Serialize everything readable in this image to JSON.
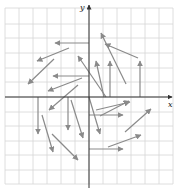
{
  "diagram": {
    "type": "vector-field",
    "axes": {
      "x_label": "x",
      "y_label": "y",
      "origin_px": [
        89,
        97
      ],
      "unit_px": 14.5
    },
    "grid": {
      "x_lines_px": [
        5,
        19,
        33,
        47,
        61,
        75,
        89,
        103,
        117,
        131,
        145,
        159,
        173
      ],
      "y_lines_px": [
        8,
        24,
        38,
        53,
        68,
        82,
        97,
        112,
        126,
        141,
        155,
        170,
        184
      ],
      "color": "#d6d6d6"
    },
    "colors": {
      "axis": "#333333",
      "arrow": "#8a8a8a",
      "background": "#ffffff"
    },
    "arrows": [
      {
        "from": [
          89,
          43
        ],
        "to": [
          55,
          43
        ]
      },
      {
        "from": [
          69,
          48
        ],
        "to": [
          37,
          61
        ]
      },
      {
        "from": [
          54,
          59
        ],
        "to": [
          28,
          84
        ]
      },
      {
        "from": [
          89,
          76
        ],
        "to": [
          53,
          76
        ]
      },
      {
        "from": [
          82,
          78
        ],
        "to": [
          48,
          91
        ]
      },
      {
        "from": [
          78,
          85
        ],
        "to": [
          49,
          110
        ]
      },
      {
        "from": [
          106,
          97
        ],
        "to": [
          78,
          56
        ]
      },
      {
        "from": [
          104,
          97
        ],
        "to": [
          96,
          61
        ]
      },
      {
        "from": [
          110,
          97
        ],
        "to": [
          110,
          61
        ]
      },
      {
        "from": [
          126,
          84
        ],
        "to": [
          101,
          33
        ]
      },
      {
        "from": [
          138,
          58
        ],
        "to": [
          105,
          44
        ]
      },
      {
        "from": [
          140,
          97
        ],
        "to": [
          140,
          61
        ]
      },
      {
        "from": [
          100,
          116
        ],
        "to": [
          129,
          101
        ]
      },
      {
        "from": [
          89,
          115
        ],
        "to": [
          123,
          115
        ]
      },
      {
        "from": [
          96,
          110
        ],
        "to": [
          130,
          102
        ]
      },
      {
        "from": [
          125,
          132
        ],
        "to": [
          151,
          109
        ]
      },
      {
        "from": [
          108,
          147
        ],
        "to": [
          141,
          135
        ]
      },
      {
        "from": [
          89,
          149
        ],
        "to": [
          123,
          149
        ]
      },
      {
        "from": [
          89,
          97
        ],
        "to": [
          100,
          134
        ]
      },
      {
        "from": [
          68,
          97
        ],
        "to": [
          68,
          130
        ]
      },
      {
        "from": [
          38,
          97
        ],
        "to": [
          38,
          134
        ]
      },
      {
        "from": [
          42,
          115
        ],
        "to": [
          53,
          152
        ]
      },
      {
        "from": [
          52,
          134
        ],
        "to": [
          78,
          160
        ]
      },
      {
        "from": [
          71,
          100
        ],
        "to": [
          83,
          138
        ]
      }
    ]
  }
}
